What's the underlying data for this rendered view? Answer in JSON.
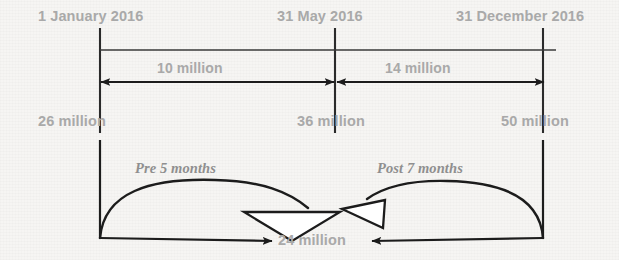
{
  "diagram": {
    "type": "timeline-reconciliation",
    "timeline": {
      "ticks": [
        {
          "id": "start",
          "date_label": "1 January 2016",
          "value_label": "26 million",
          "x": 100
        },
        {
          "id": "middle",
          "date_label": "31 May 2016",
          "value_label": "36 million",
          "x": 335
        },
        {
          "id": "end",
          "date_label": "31 December 2016",
          "value_label": "50 million",
          "x": 543
        }
      ]
    },
    "measures": [
      {
        "id": "pre-delta",
        "label": "10 million",
        "from_x": 100,
        "to_x": 335
      },
      {
        "id": "post-delta",
        "label": "14 million",
        "from_x": 335,
        "to_x": 543
      }
    ],
    "arcs": [
      {
        "id": "pre-arc",
        "label": "Pre 5 months",
        "label_x": 135,
        "label_y": 160
      },
      {
        "id": "post-arc",
        "label": "Post 7 months",
        "label_x": 377,
        "label_y": 160
      }
    ],
    "bottom": {
      "label": "24 million"
    },
    "colors": {
      "background": "#f6f5f3",
      "text": "#a9a9a9",
      "arc_text": "#8f8f8f",
      "stroke": "#1c1c1c",
      "triangle_fill": "#ffffff"
    }
  }
}
